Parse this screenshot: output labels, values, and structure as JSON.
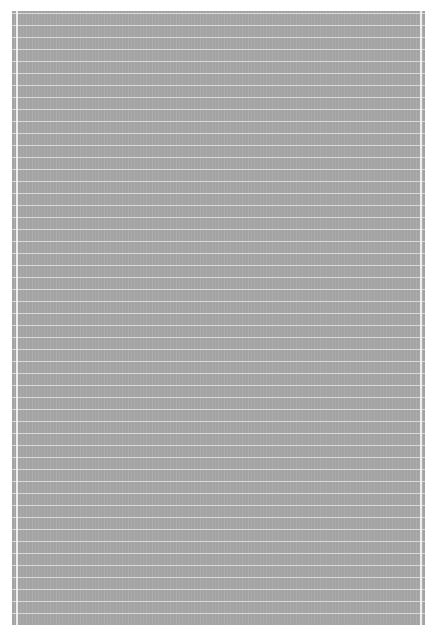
{
  "page": {
    "colors": {
      "background": "#ffffff",
      "sheet": "#a3a3a3",
      "rule_lines": "#ebebeb"
    }
  }
}
